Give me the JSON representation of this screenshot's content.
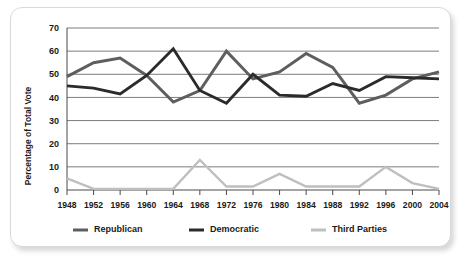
{
  "chart_data": {
    "type": "line",
    "title": "",
    "xlabel": "",
    "ylabel": "Percentage of Total Vote",
    "ylim": [
      0,
      70
    ],
    "yticks": [
      0,
      10,
      20,
      30,
      40,
      50,
      60,
      70
    ],
    "ytick_labels": [
      "0",
      "10",
      "20",
      "30",
      "40",
      "50",
      "60",
      "70"
    ],
    "grid": true,
    "legend_position": "bottom",
    "categories": [
      "1948",
      "1952",
      "1956",
      "1960",
      "1964",
      "1968",
      "1972",
      "1976",
      "1980",
      "1984",
      "1988",
      "1992",
      "1996",
      "2000",
      "2004"
    ],
    "x": [
      1948,
      1952,
      1956,
      1960,
      1964,
      1968,
      1972,
      1976,
      1980,
      1984,
      1988,
      1992,
      1996,
      2000,
      2004
    ],
    "series": [
      {
        "name": "Republican",
        "color": "#5e5e5e",
        "values": [
          49,
          55,
          57,
          49.5,
          38,
          43,
          60,
          48,
          51,
          59,
          53,
          37.5,
          41,
          48,
          51
        ]
      },
      {
        "name": "Democratic",
        "color": "#2b2b2b",
        "values": [
          45,
          44,
          41.5,
          49.5,
          61,
          43,
          37.5,
          50,
          41,
          40.5,
          46,
          43,
          49,
          48.5,
          48
        ]
      },
      {
        "name": "Third Parties",
        "color": "#bfbfbf",
        "values": [
          5,
          0.5,
          0.5,
          0.5,
          0.5,
          13,
          1.5,
          1.5,
          7,
          1.5,
          1.5,
          1.5,
          10,
          3,
          0.5
        ]
      }
    ]
  },
  "legend": {
    "items": [
      {
        "label": "Republican",
        "color": "#5e5e5e"
      },
      {
        "label": "Democratic",
        "color": "#2b2b2b"
      },
      {
        "label": "Third Parties",
        "color": "#bfbfbf"
      }
    ]
  },
  "colors": {
    "republican": "#5e5e5e",
    "democratic": "#2b2b2b",
    "third_parties": "#bfbfbf",
    "grid": "#5a5a5a",
    "axis": "#4a4a4a",
    "text": "#1a1a1a",
    "card_background": "#ffffff",
    "card_border": "#d9d9d9"
  }
}
